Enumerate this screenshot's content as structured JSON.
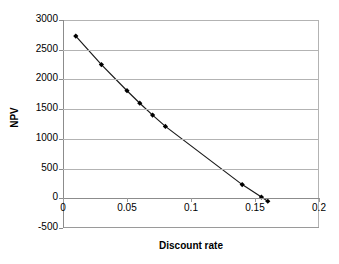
{
  "chart_data": {
    "type": "line",
    "title": "",
    "xlabel": "Discount rate",
    "ylabel": "NPV",
    "xlim": [
      0,
      0.2
    ],
    "ylim": [
      -500,
      3000
    ],
    "grid": true,
    "legend": false,
    "marker": "diamond",
    "series": [
      {
        "name": "NPV",
        "x": [
          0.01,
          0.03,
          0.05,
          0.06,
          0.07,
          0.08,
          0.14,
          0.155,
          0.16
        ],
        "values": [
          2730,
          2250,
          1810,
          1600,
          1400,
          1210,
          230,
          20,
          -50
        ]
      }
    ],
    "x_ticks": [
      "0",
      "0.05",
      "0.1",
      "0.15",
      "0.2"
    ],
    "x_tick_values": [
      0,
      0.05,
      0.1,
      0.15,
      0.2
    ],
    "y_ticks": [
      "3000",
      "2500",
      "2000",
      "1500",
      "1000",
      "500",
      "0",
      "-500"
    ],
    "y_tick_values": [
      3000,
      2500,
      2000,
      1500,
      1000,
      500,
      0,
      -500
    ],
    "colors": {
      "line": "#1a1a1a",
      "marker": "#000000",
      "grid": "#b3b3b3",
      "axis": "#8c8c8c",
      "background": "#ffffff",
      "text": "#000000"
    }
  },
  "axis_titles": {
    "x": "Discount rate",
    "y": "NPV"
  }
}
